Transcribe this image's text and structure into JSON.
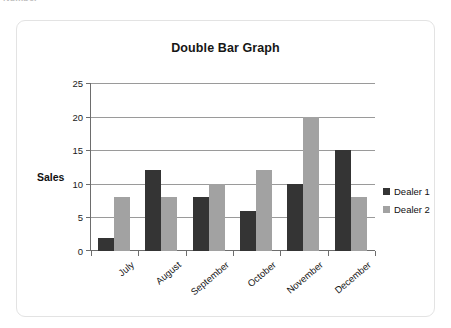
{
  "page": {
    "clipped_top_text": "Number"
  },
  "card": {
    "border_color": "#e3e3e3",
    "background": "#ffffff"
  },
  "legend": {
    "position": "right",
    "items": [
      {
        "label": "Dealer 1",
        "color": "#343434"
      },
      {
        "label": "Dealer 2",
        "color": "#a2a2a2"
      }
    ]
  },
  "chart_data": {
    "type": "bar",
    "title": "Double Bar Graph",
    "xlabel": "",
    "ylabel": "Sales",
    "categories": [
      "July",
      "August",
      "September",
      "October",
      "November",
      "December"
    ],
    "series": [
      {
        "name": "Dealer 1",
        "color": "#343434",
        "values": [
          2,
          12,
          8,
          6,
          10,
          15
        ]
      },
      {
        "name": "Dealer 2",
        "color": "#a2a2a2",
        "values": [
          8,
          8,
          10,
          12,
          20,
          8
        ]
      }
    ],
    "ylim": [
      0,
      25
    ],
    "yticks": [
      0,
      5,
      10,
      15,
      20,
      25
    ],
    "grid": true,
    "legend_position": "right",
    "xtick_rotation": -40
  }
}
